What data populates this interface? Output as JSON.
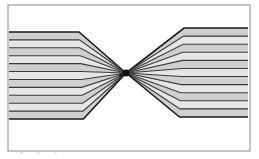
{
  "diagram": {
    "type": "fan-in line bundle",
    "frame": {
      "x": 8,
      "y": 5,
      "width": 242,
      "height": 146,
      "stroke": "#8a8a8a"
    },
    "focal_point": {
      "x": 126,
      "y": 73,
      "radius": 3.5,
      "color": "#111111"
    },
    "secondary_point": {
      "x": 121,
      "y": 75,
      "radius": 2,
      "color": "#222222"
    },
    "left_bundle": {
      "line_count": 12,
      "x_start": 9,
      "x_bend": 79,
      "y_top": 32,
      "y_bottom": 119,
      "bend_shift_top": -4,
      "bend_shift_bottom": 0
    },
    "right_bundle": {
      "line_count": 12,
      "x_end": 248,
      "x_bend": 184,
      "y_top": 28,
      "y_bottom": 117
    },
    "colors": {
      "line": "#3a3a3a",
      "edge_line": "#1a1a1a",
      "band_fill": "#cfcfcf",
      "band_fill_light": "#e6e6e6"
    }
  },
  "caption": {
    "text": "ᵃ ᵇ ᶜ"
  }
}
